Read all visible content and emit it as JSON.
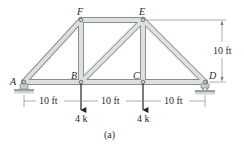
{
  "figure": {
    "caption": "(a)",
    "nodes": {
      "A": {
        "label": "A",
        "x": 24,
        "y": 82
      },
      "B": {
        "label": "B",
        "x": 81,
        "y": 82
      },
      "C": {
        "label": "C",
        "x": 143,
        "y": 82
      },
      "D": {
        "label": "D",
        "x": 205,
        "y": 82
      },
      "E": {
        "label": "E",
        "x": 143,
        "y": 20
      },
      "F": {
        "label": "F",
        "x": 81,
        "y": 20
      }
    },
    "members": [
      "AB",
      "BC",
      "CD",
      "AF",
      "FE",
      "ED",
      "BF",
      "CE",
      "BE"
    ],
    "dimensions": {
      "span_1": "10 ft",
      "span_2": "10 ft",
      "span_3": "10 ft",
      "height": "10 ft"
    },
    "loads": {
      "B": "4 k",
      "C": "4 k"
    },
    "colors": {
      "member_fill": "#d4d8d8",
      "member_edge": "#8a8f90",
      "text": "#2a2a2a",
      "dim_line": "#777777"
    }
  }
}
